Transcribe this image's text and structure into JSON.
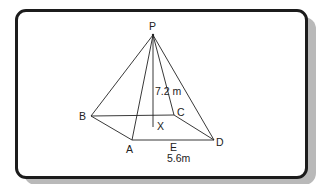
{
  "diagram": {
    "type": "square-based pyramid",
    "vertices": {
      "P": {
        "label": "P",
        "x": 153,
        "y": 35
      },
      "A": {
        "label": "A",
        "x": 132,
        "y": 140
      },
      "B": {
        "label": "B",
        "x": 91,
        "y": 116
      },
      "C": {
        "label": "C",
        "x": 174,
        "y": 115
      },
      "D": {
        "label": "D",
        "x": 214,
        "y": 140
      },
      "X": {
        "label": "X",
        "x": 153,
        "y": 127
      },
      "E": {
        "label": "E"
      }
    },
    "measurements": {
      "height_label": "7.2 m",
      "base_label": "5.6m"
    },
    "colors": {
      "line": "#222222",
      "frame_border": "#1c1c1c",
      "shadow": "#b9b9b9"
    }
  }
}
